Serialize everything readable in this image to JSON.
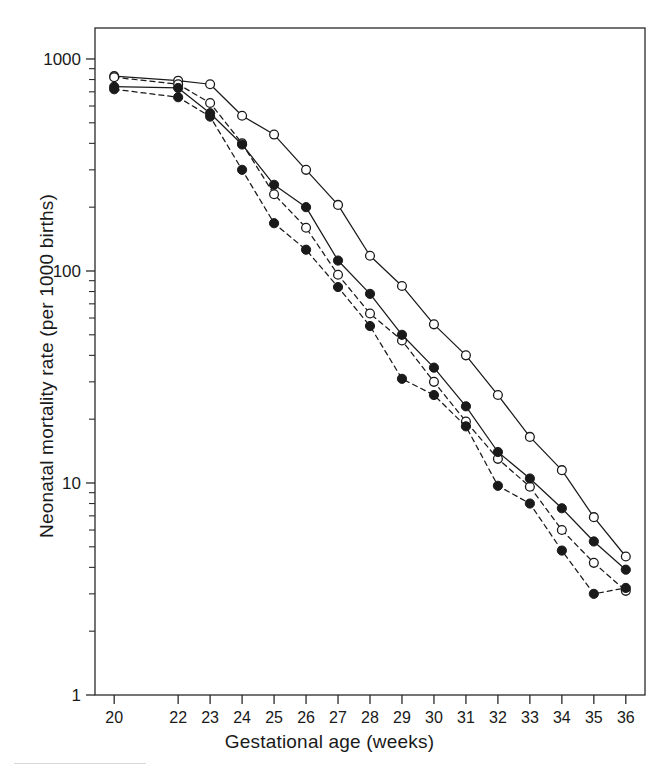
{
  "chart_data": {
    "type": "line",
    "title": "",
    "xlabel": "Gestational age (weeks)",
    "ylabel": "Neonatal mortality rate (per 1000 births)",
    "xlim": [
      19.4,
      36.6
    ],
    "ylim": [
      1,
      1400
    ],
    "yscale": "log",
    "grid": false,
    "legend_position": "none",
    "x_tick_labels": [
      "20",
      "22",
      "23",
      "24",
      "25",
      "26",
      "27",
      "28",
      "29",
      "30",
      "31",
      "32",
      "33",
      "34",
      "35",
      "36"
    ],
    "x_tick_values": [
      20,
      22,
      23,
      24,
      25,
      26,
      27,
      28,
      29,
      30,
      31,
      32,
      33,
      34,
      35,
      36
    ],
    "y_major_ticks": [
      1,
      10,
      100,
      1000
    ],
    "y_major_tick_labels": [
      "1",
      "10",
      "100",
      "1000"
    ],
    "y_minor_ticks": [
      2,
      3,
      4,
      5,
      6,
      7,
      8,
      9,
      20,
      30,
      40,
      50,
      60,
      70,
      80,
      90,
      200,
      300,
      400,
      500,
      600,
      700,
      800,
      900
    ],
    "series": [
      {
        "name": "series-1-open-solid",
        "marker": "open-circle",
        "linestyle": "solid",
        "color": "#1a1a1a",
        "x": [
          20,
          22,
          23,
          24,
          25,
          26,
          27,
          28,
          29,
          30,
          31,
          32,
          33,
          34,
          35,
          36
        ],
        "values": [
          830,
          790,
          760,
          540,
          440,
          300,
          205,
          118,
          85,
          56,
          40,
          26,
          16.5,
          11.5,
          6.9,
          4.5
        ]
      },
      {
        "name": "series-2-open-dashed",
        "marker": "open-circle",
        "linestyle": "dashed",
        "color": "#1a1a1a",
        "x": [
          20,
          22,
          23,
          24,
          25,
          26,
          27,
          28,
          29,
          30,
          31,
          32,
          33,
          34,
          35,
          36
        ],
        "values": [
          820,
          760,
          620,
          400,
          230,
          160,
          96,
          63,
          47,
          30,
          19.5,
          13,
          9.6,
          6.0,
          4.2,
          3.1
        ]
      },
      {
        "name": "series-3-filled-solid",
        "marker": "filled-circle",
        "linestyle": "solid",
        "color": "#1a1a1a",
        "x": [
          20,
          22,
          23,
          24,
          25,
          26,
          27,
          28,
          29,
          30,
          31,
          32,
          33,
          34,
          35,
          36
        ],
        "values": [
          740,
          730,
          555,
          395,
          255,
          200,
          112,
          78,
          50,
          35,
          23,
          14,
          10.5,
          7.6,
          5.3,
          3.9
        ]
      },
      {
        "name": "series-4-filled-dashed",
        "marker": "filled-circle",
        "linestyle": "dashed",
        "color": "#1a1a1a",
        "x": [
          20,
          22,
          23,
          24,
          25,
          26,
          27,
          28,
          29,
          30,
          31,
          32,
          33,
          34,
          35,
          36
        ],
        "values": [
          720,
          660,
          535,
          300,
          168,
          126,
          84,
          55,
          31,
          26,
          18.5,
          9.7,
          8.0,
          4.8,
          3.0,
          3.2
        ]
      }
    ]
  }
}
